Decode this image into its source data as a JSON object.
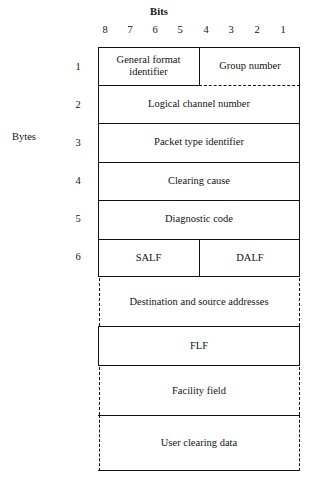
{
  "diagram": {
    "title_bits": "Bits",
    "side_label": "Bytes",
    "bit_numbers": [
      "8",
      "7",
      "6",
      "5",
      "4",
      "3",
      "2",
      "1"
    ],
    "byte_numbers": [
      "1",
      "2",
      "3",
      "4",
      "5",
      "6"
    ],
    "fields": [
      {
        "name": "general-format-identifier",
        "label": "General format\nidentifier",
        "byte": "1",
        "bits": "8-5",
        "border": "solid"
      },
      {
        "name": "group-number",
        "label": "Group number",
        "byte": "1",
        "bits": "4-1",
        "border": "solid-dashed-bottom"
      },
      {
        "name": "logical-channel-number",
        "label": "Logical channel number",
        "byte": "2",
        "bits": "8-1",
        "border": "solid"
      },
      {
        "name": "packet-type-identifier",
        "label": "Packet type identifier",
        "byte": "3",
        "bits": "8-1",
        "border": "solid"
      },
      {
        "name": "clearing-cause",
        "label": "Clearing cause",
        "byte": "4",
        "bits": "8-1",
        "border": "solid"
      },
      {
        "name": "diagnostic-code",
        "label": "Diagnostic code",
        "byte": "5",
        "bits": "8-1",
        "border": "solid"
      },
      {
        "name": "salf",
        "label": "SALF",
        "byte": "6",
        "bits": "8-5",
        "border": "solid"
      },
      {
        "name": "dalf",
        "label": "DALF",
        "byte": "6",
        "bits": "4-1",
        "border": "solid"
      },
      {
        "name": "destination-and-source-addresses",
        "label": "Destination and source addresses",
        "byte": "",
        "bits": "",
        "border": "dashed-sides"
      },
      {
        "name": "flf",
        "label": "FLF",
        "byte": "",
        "bits": "",
        "border": "solid"
      },
      {
        "name": "facility-field",
        "label": "Facility field",
        "byte": "",
        "bits": "",
        "border": "dashed-sides"
      },
      {
        "name": "user-clearing-data",
        "label": "User clearing data",
        "byte": "",
        "bits": "",
        "border": "dashed-sides-solid-bottom"
      }
    ],
    "colors": {
      "line": "#111111",
      "text": "#141414",
      "background": "#ffffff"
    }
  }
}
